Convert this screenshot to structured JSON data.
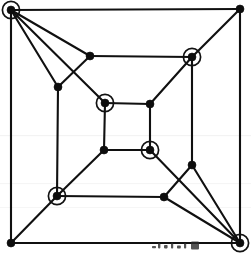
{
  "figure": {
    "background_color": "#ffffff",
    "line_color": "#101010",
    "node_fill_color": "#0d0d0d",
    "ring_color": "#121212",
    "width": 251,
    "height": 259
  },
  "geometry": {
    "node_radius": 4.0,
    "ring_radius": 8.6,
    "edge_width": 2.1
  },
  "graph": {
    "node_count": 20,
    "marked_count": 6,
    "nodes": [
      {
        "id": "outer-tl",
        "label": "outer top-left corner",
        "x": 11,
        "y": 10,
        "marked": true,
        "ring": true
      },
      {
        "id": "outer-tr",
        "label": "outer top-right corner",
        "x": 240,
        "y": 9,
        "marked": false,
        "ring": false
      },
      {
        "id": "outer-bl",
        "label": "outer bottom-left corner",
        "x": 11,
        "y": 243,
        "marked": false,
        "ring": false
      },
      {
        "id": "outer-br",
        "label": "outer bottom-right corner",
        "x": 240,
        "y": 243,
        "marked": true,
        "ring": true
      },
      {
        "id": "mid-tl",
        "label": "middle top-left corner",
        "x": 90,
        "y": 56,
        "marked": false,
        "ring": false
      },
      {
        "id": "mid-tr",
        "label": "middle top-right corner",
        "x": 192,
        "y": 57,
        "marked": true,
        "ring": true
      },
      {
        "id": "mid-bl",
        "label": "middle bottom-left corner",
        "x": 57,
        "y": 196,
        "marked": true,
        "ring": true
      },
      {
        "id": "mid-br",
        "label": "middle bottom-right corner",
        "x": 164,
        "y": 197,
        "marked": false,
        "ring": false
      },
      {
        "id": "inner-tl",
        "label": "inner top-left corner",
        "x": 105,
        "y": 103,
        "marked": true,
        "ring": true
      },
      {
        "id": "inner-tr",
        "label": "inner top-right corner",
        "x": 150,
        "y": 104,
        "marked": false,
        "ring": false
      },
      {
        "id": "inner-bl",
        "label": "inner bottom-left corner",
        "x": 104,
        "y": 150,
        "marked": false,
        "ring": false
      },
      {
        "id": "inner-br",
        "label": "inner bottom-right corner",
        "x": 150,
        "y": 150,
        "marked": true,
        "ring": true
      },
      {
        "id": "left-upper",
        "label": "left side upper junction",
        "x": 58,
        "y": 87,
        "marked": false,
        "ring": false
      },
      {
        "id": "right-lower",
        "label": "right side lower junction",
        "x": 192,
        "y": 165,
        "marked": false,
        "ring": false
      }
    ],
    "edges": [
      {
        "from": "outer-tl",
        "to": "outer-tr",
        "kind": "outer-square-top"
      },
      {
        "from": "outer-tr",
        "to": "outer-br",
        "kind": "outer-square-right"
      },
      {
        "from": "outer-br",
        "to": "outer-bl",
        "kind": "outer-square-bottom"
      },
      {
        "from": "outer-bl",
        "to": "outer-tl",
        "kind": "outer-square-left"
      },
      {
        "from": "mid-tl",
        "to": "mid-tr",
        "kind": "middle-square-top"
      },
      {
        "from": "mid-tr",
        "to": "right-lower",
        "kind": "middle-square-right"
      },
      {
        "from": "right-lower",
        "to": "mid-br",
        "kind": "middle-square-right-lower"
      },
      {
        "from": "mid-br",
        "to": "mid-bl",
        "kind": "middle-square-bottom"
      },
      {
        "from": "mid-bl",
        "to": "left-upper",
        "kind": "middle-square-left-lower"
      },
      {
        "from": "left-upper",
        "to": "mid-tl",
        "kind": "middle-square-left"
      },
      {
        "from": "inner-tl",
        "to": "inner-tr",
        "kind": "inner-square-top"
      },
      {
        "from": "inner-tr",
        "to": "inner-br",
        "kind": "inner-square-right"
      },
      {
        "from": "inner-br",
        "to": "inner-bl",
        "kind": "inner-square-bottom"
      },
      {
        "from": "inner-bl",
        "to": "inner-tl",
        "kind": "inner-square-left"
      },
      {
        "from": "outer-tl",
        "to": "mid-tl",
        "kind": "spoke-top-left-outer"
      },
      {
        "from": "outer-tl",
        "to": "left-upper",
        "kind": "spoke-top-left-side"
      },
      {
        "from": "outer-tl",
        "to": "inner-tl",
        "kind": "spoke-top-left-deep"
      },
      {
        "from": "outer-tr",
        "to": "mid-tr",
        "kind": "spoke-top-right-outer"
      },
      {
        "from": "mid-tr",
        "to": "inner-tr",
        "kind": "spoke-top-right-deep"
      },
      {
        "from": "outer-bl",
        "to": "mid-bl",
        "kind": "spoke-bottom-left-outer"
      },
      {
        "from": "mid-bl",
        "to": "inner-bl",
        "kind": "spoke-bottom-left-deep"
      },
      {
        "from": "outer-br",
        "to": "mid-br",
        "kind": "spoke-bottom-right-outer"
      },
      {
        "from": "outer-br",
        "to": "right-lower",
        "kind": "spoke-bottom-right-side"
      },
      {
        "from": "outer-br",
        "to": "inner-br",
        "kind": "spoke-bottom-right-deep"
      }
    ],
    "marked_nodes": [
      "outer-tl",
      "outer-br",
      "mid-tr",
      "mid-bl",
      "inner-tl",
      "inner-br"
    ]
  }
}
